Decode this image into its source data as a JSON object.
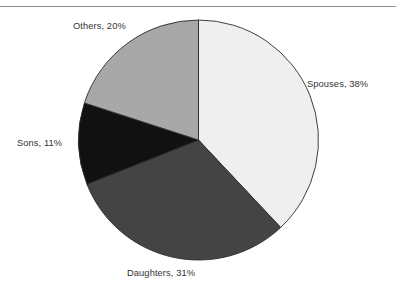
{
  "page": {
    "background_color": "#ffffff",
    "divider_color": "#8f8f8f",
    "label_text_color": "#333333",
    "slice_outline_color": "#2b2b2b"
  },
  "chart_data": {
    "type": "pie",
    "title": "",
    "subtitle": "",
    "xlabel": "",
    "ylabel": "",
    "legend_position": "none",
    "labels_position": "outside",
    "grid": false,
    "start_angle_deg": 0,
    "direction": "clockwise",
    "categories": [
      "Spouses",
      "Daughters",
      "Sons",
      "Others"
    ],
    "values": [
      38,
      31,
      11,
      20
    ],
    "units": "percent",
    "total": 100,
    "colors": [
      "#efefef",
      "#444444",
      "#111111",
      "#a8a8a8"
    ],
    "slices": [
      {
        "name": "Spouses",
        "value": 38,
        "percent_text": "38%",
        "label": "Spouses, 38%",
        "color": "#efefef",
        "start_deg": 0,
        "end_deg": 136.8
      },
      {
        "name": "Daughters",
        "value": 31,
        "percent_text": "31%",
        "label": "Daughters, 31%",
        "color": "#444444",
        "start_deg": 136.8,
        "end_deg": 248.4
      },
      {
        "name": "Sons",
        "value": 11,
        "percent_text": "11%",
        "label": "Sons, 11%",
        "color": "#111111",
        "start_deg": 248.4,
        "end_deg": 288.0
      },
      {
        "name": "Others",
        "value": 20,
        "percent_text": "20%",
        "label": "Others, 20%",
        "color": "#a8a8a8",
        "start_deg": 288.0,
        "end_deg": 360.0
      }
    ]
  }
}
